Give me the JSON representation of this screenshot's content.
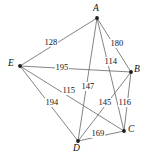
{
  "figure": {
    "name": "weighted-graph",
    "background": "#ffffff",
    "width": 145,
    "height": 158,
    "edge_color": "#6e6e72",
    "vertex_color": "#1c1c1e",
    "text_color": "#131316"
  },
  "chart_data": {
    "type": "diagram",
    "subtype": "weighted-undirected-graph",
    "title": "",
    "xlabel": "",
    "ylabel": "",
    "nodes": [
      {
        "id": "A",
        "label": "A",
        "x": 97,
        "y": 18,
        "label_x": 93,
        "label_y": 4
      },
      {
        "id": "B",
        "label": "B",
        "x": 131,
        "y": 72,
        "label_x": 134,
        "label_y": 65
      },
      {
        "id": "C",
        "label": "C",
        "x": 124,
        "y": 131,
        "label_x": 128,
        "label_y": 125
      },
      {
        "id": "D",
        "label": "D",
        "x": 78,
        "y": 141,
        "label_x": 73,
        "label_y": 144
      },
      {
        "id": "E",
        "label": "E",
        "x": 20,
        "y": 66,
        "label_x": 8,
        "label_y": 59
      }
    ],
    "edges": [
      {
        "from": "A",
        "to": "E",
        "weight": 128,
        "label": "128",
        "label_x": 44,
        "label_y": 38
      },
      {
        "from": "A",
        "to": "B",
        "weight": 180,
        "label": "180",
        "label_x": 110,
        "label_y": 39
      },
      {
        "from": "A",
        "to": "C",
        "weight": 114,
        "label": "114",
        "label_x": 104,
        "label_y": 57
      },
      {
        "from": "A",
        "to": "D",
        "weight": 147,
        "label": "147",
        "label_x": 81,
        "label_y": 82
      },
      {
        "from": "E",
        "to": "B",
        "weight": 195,
        "label": "195",
        "label_x": 55,
        "label_y": 63
      },
      {
        "from": "E",
        "to": "C",
        "weight": 115,
        "label": "115",
        "label_x": 62,
        "label_y": 86
      },
      {
        "from": "E",
        "to": "D",
        "weight": 194,
        "label": "194",
        "label_x": 45,
        "label_y": 98
      },
      {
        "from": "B",
        "to": "D",
        "weight": 145,
        "label": "145",
        "label_x": 98,
        "label_y": 98
      },
      {
        "from": "B",
        "to": "C",
        "weight": 116,
        "label": "116",
        "label_x": 118,
        "label_y": 98
      },
      {
        "from": "C",
        "to": "D",
        "weight": 169,
        "label": "169",
        "label_x": 91,
        "label_y": 129
      }
    ]
  }
}
